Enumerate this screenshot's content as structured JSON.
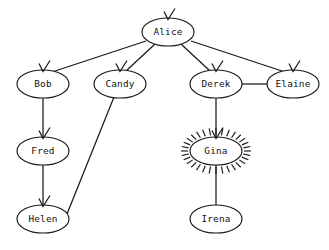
{
  "diagram": {
    "type": "directed-graph",
    "title": "",
    "background_color": "#ffffff",
    "stroke_color": "#1a1a1a",
    "node_fill_color": "#ffffff",
    "highlight_node": "Gina",
    "highlight_style": "radial-burst",
    "nodes": [
      {
        "id": "alice",
        "label": "Alice",
        "cx": 168,
        "cy": 32,
        "rx": 26,
        "ry": 14,
        "highlighted": false,
        "incoming_marker": true
      },
      {
        "id": "bob",
        "label": "Bob",
        "cx": 43,
        "cy": 84,
        "rx": 26,
        "ry": 14,
        "highlighted": false,
        "incoming_marker": true
      },
      {
        "id": "candy",
        "label": "Candy",
        "cx": 120,
        "cy": 84,
        "rx": 26,
        "ry": 14,
        "highlighted": false,
        "incoming_marker": true
      },
      {
        "id": "derek",
        "label": "Derek",
        "cx": 216,
        "cy": 84,
        "rx": 26,
        "ry": 14,
        "highlighted": false,
        "incoming_marker": true
      },
      {
        "id": "elaine",
        "label": "Elaine",
        "cx": 293,
        "cy": 84,
        "rx": 26,
        "ry": 14,
        "highlighted": false,
        "incoming_marker": true
      },
      {
        "id": "fred",
        "label": "Fred",
        "cx": 43,
        "cy": 151,
        "rx": 26,
        "ry": 14,
        "highlighted": false,
        "incoming_marker": true
      },
      {
        "id": "gina",
        "label": "Gina",
        "cx": 216,
        "cy": 151,
        "rx": 26,
        "ry": 14,
        "highlighted": true,
        "incoming_marker": true
      },
      {
        "id": "helen",
        "label": "Helen",
        "cx": 43,
        "cy": 219,
        "rx": 26,
        "ry": 14,
        "highlighted": false,
        "incoming_marker": true
      },
      {
        "id": "irena",
        "label": "Irena",
        "cx": 216,
        "cy": 219,
        "rx": 26,
        "ry": 14,
        "highlighted": false,
        "incoming_marker": false
      }
    ],
    "edges": [
      {
        "id": "e-alice-bob",
        "from": "alice",
        "to": "bob",
        "x1": 146,
        "y1": 41,
        "x2": 52,
        "y2": 72,
        "arrow": true
      },
      {
        "id": "e-alice-candy",
        "from": "alice",
        "to": "candy",
        "x1": 155,
        "y1": 44,
        "x2": 126,
        "y2": 71,
        "arrow": true
      },
      {
        "id": "e-alice-derek",
        "from": "alice",
        "to": "derek",
        "x1": 181,
        "y1": 44,
        "x2": 210,
        "y2": 71,
        "arrow": true
      },
      {
        "id": "e-alice-elaine",
        "from": "alice",
        "to": "elaine",
        "x1": 191,
        "y1": 41,
        "x2": 285,
        "y2": 72,
        "arrow": true
      },
      {
        "id": "e-bob-fred",
        "from": "bob",
        "to": "fred",
        "x1": 43,
        "y1": 98,
        "x2": 43,
        "y2": 138,
        "arrow": true
      },
      {
        "id": "e-fred-helen",
        "from": "fred",
        "to": "helen",
        "x1": 43,
        "y1": 165,
        "x2": 43,
        "y2": 206,
        "arrow": true
      },
      {
        "id": "e-candy-helen",
        "from": "candy",
        "to": "helen",
        "x1": 114,
        "y1": 97,
        "x2": 67,
        "y2": 214,
        "arrow": false
      },
      {
        "id": "e-derek-elaine",
        "from": "derek",
        "to": "elaine",
        "x1": 242,
        "y1": 84,
        "x2": 267,
        "y2": 84,
        "arrow": false
      },
      {
        "id": "e-derek-gina",
        "from": "derek",
        "to": "gina",
        "x1": 216,
        "y1": 98,
        "x2": 216,
        "y2": 138,
        "arrow": true
      },
      {
        "id": "e-gina-irena",
        "from": "gina",
        "to": "irena",
        "x1": 216,
        "y1": 165,
        "x2": 216,
        "y2": 205,
        "arrow": false
      }
    ],
    "burst": {
      "ray_count": 32,
      "inner_offset": 2,
      "ray_length": 7
    }
  }
}
